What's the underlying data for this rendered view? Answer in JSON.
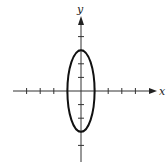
{
  "diagram": {
    "type": "ellipse-on-axes",
    "x_label": "x",
    "y_label": "y",
    "origin_px": [
      81,
      91
    ],
    "unit_px": 13.6,
    "x_ticks": [
      -4,
      -3,
      -2,
      -1,
      1,
      2,
      3,
      4
    ],
    "y_ticks": [
      -4,
      -3,
      -2,
      -1,
      1,
      2,
      3,
      4
    ],
    "ellipse": {
      "center": [
        0,
        0
      ],
      "semi_axis_x": 1,
      "semi_axis_y": 3,
      "equation": "x^2 + y^2/9 = 1"
    },
    "colors": {
      "axis": "#333333",
      "curve": "#111111",
      "background": "#ffffff"
    }
  }
}
